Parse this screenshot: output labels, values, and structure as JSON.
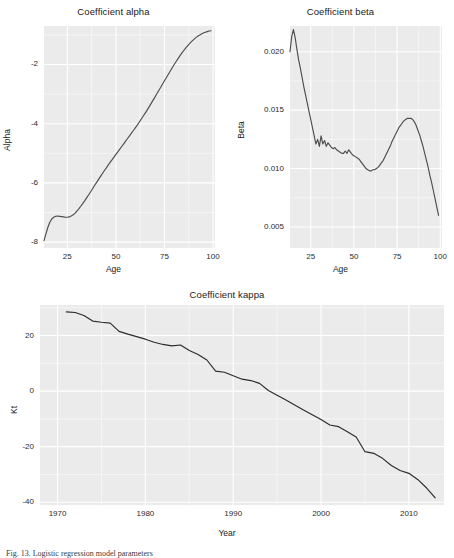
{
  "figure": {
    "caption": "Fig. 13. Logistic regression model parameters"
  },
  "chart_data": [
    {
      "id": "alpha",
      "type": "line",
      "title": "Coefficient alpha",
      "xlabel": "Age",
      "ylabel": "Alpha",
      "xlim": [
        13,
        101
      ],
      "ylim": [
        -8.2,
        -0.7
      ],
      "xticks": [
        25,
        50,
        75,
        100
      ],
      "yticks": [
        -8,
        -6,
        -4,
        -2
      ],
      "grid": true,
      "legend": "none",
      "line_color": "#4d4d4d",
      "x": [
        13,
        14,
        15,
        16,
        17,
        18,
        19,
        20,
        21,
        22,
        23,
        24,
        25,
        26,
        27,
        28,
        29,
        30,
        31,
        32,
        33,
        34,
        35,
        36,
        37,
        38,
        39,
        40,
        41,
        42,
        43,
        44,
        45,
        46,
        47,
        48,
        49,
        50,
        51,
        52,
        53,
        54,
        55,
        56,
        57,
        58,
        59,
        60,
        61,
        62,
        63,
        64,
        65,
        66,
        67,
        68,
        69,
        70,
        71,
        72,
        73,
        74,
        75,
        76,
        77,
        78,
        79,
        80,
        81,
        82,
        83,
        84,
        85,
        86,
        87,
        88,
        89,
        90,
        91,
        92,
        93,
        94,
        95,
        96,
        97,
        98,
        99
      ],
      "y": [
        -7.95,
        -7.72,
        -7.5,
        -7.33,
        -7.22,
        -7.16,
        -7.13,
        -7.12,
        -7.13,
        -7.14,
        -7.15,
        -7.16,
        -7.16,
        -7.15,
        -7.12,
        -7.08,
        -7.02,
        -6.95,
        -6.87,
        -6.78,
        -6.69,
        -6.6,
        -6.5,
        -6.4,
        -6.3,
        -6.2,
        -6.09,
        -5.99,
        -5.89,
        -5.79,
        -5.69,
        -5.59,
        -5.5,
        -5.4,
        -5.31,
        -5.22,
        -5.13,
        -5.04,
        -4.95,
        -4.86,
        -4.77,
        -4.68,
        -4.59,
        -4.5,
        -4.41,
        -4.32,
        -4.23,
        -4.14,
        -4.05,
        -3.95,
        -3.85,
        -3.75,
        -3.65,
        -3.55,
        -3.44,
        -3.33,
        -3.22,
        -3.11,
        -3.0,
        -2.89,
        -2.78,
        -2.66,
        -2.55,
        -2.44,
        -2.33,
        -2.22,
        -2.11,
        -2.0,
        -1.9,
        -1.8,
        -1.7,
        -1.61,
        -1.52,
        -1.44,
        -1.36,
        -1.29,
        -1.22,
        -1.16,
        -1.1,
        -1.05,
        -1.01,
        -0.97,
        -0.94,
        -0.91,
        -0.89,
        -0.87,
        -0.86
      ]
    },
    {
      "id": "beta",
      "type": "line",
      "title": "Coefficient beta",
      "xlabel": "Age",
      "ylabel": "Beta",
      "xlim": [
        13,
        101
      ],
      "ylim": [
        0.0032,
        0.0222
      ],
      "xticks": [
        25,
        50,
        75,
        100
      ],
      "yticks": [
        0.005,
        0.01,
        0.015,
        0.02
      ],
      "ytick_labels": [
        "0.005",
        "0.010",
        "0.015",
        "0.020"
      ],
      "grid": true,
      "legend": "none",
      "line_color": "#4d4d4d",
      "x": [
        13,
        14,
        15,
        16,
        17,
        18,
        19,
        20,
        21,
        22,
        23,
        24,
        25,
        26,
        27,
        28,
        29,
        30,
        31,
        32,
        33,
        34,
        35,
        36,
        37,
        38,
        39,
        40,
        41,
        42,
        43,
        44,
        45,
        46,
        47,
        48,
        49,
        50,
        51,
        52,
        53,
        54,
        55,
        56,
        57,
        58,
        59,
        60,
        61,
        62,
        63,
        64,
        65,
        66,
        67,
        68,
        69,
        70,
        71,
        72,
        73,
        74,
        75,
        76,
        77,
        78,
        79,
        80,
        81,
        82,
        83,
        84,
        85,
        86,
        87,
        88,
        89,
        90,
        91,
        92,
        93,
        94,
        95,
        96,
        97,
        98,
        99
      ],
      "y": [
        0.02,
        0.0213,
        0.0219,
        0.0212,
        0.0202,
        0.0193,
        0.0186,
        0.0178,
        0.017,
        0.0163,
        0.0156,
        0.0149,
        0.0142,
        0.0135,
        0.0128,
        0.0121,
        0.0125,
        0.0119,
        0.0128,
        0.0121,
        0.0124,
        0.0119,
        0.0122,
        0.012,
        0.0118,
        0.0117,
        0.0118,
        0.0116,
        0.0115,
        0.0114,
        0.0113,
        0.0113,
        0.0115,
        0.0113,
        0.0116,
        0.0114,
        0.0112,
        0.0111,
        0.011,
        0.0109,
        0.0108,
        0.0106,
        0.0104,
        0.0102,
        0.01,
        0.0099,
        0.0098,
        0.0098,
        0.0099,
        0.0099,
        0.01,
        0.0101,
        0.0103,
        0.0105,
        0.0107,
        0.011,
        0.0113,
        0.0116,
        0.0119,
        0.0123,
        0.0126,
        0.0129,
        0.0132,
        0.0135,
        0.0137,
        0.0139,
        0.0141,
        0.0142,
        0.0143,
        0.0143,
        0.0143,
        0.0142,
        0.014,
        0.0137,
        0.0133,
        0.0129,
        0.0124,
        0.0119,
        0.0113,
        0.0107,
        0.0101,
        0.0094,
        0.0088,
        0.0081,
        0.0074,
        0.0067,
        0.006,
        0.0053,
        0.0046,
        0.004
      ]
    },
    {
      "id": "kappa",
      "type": "line",
      "title": "Coefficient kappa",
      "xlabel": "Year",
      "ylabel": "Kt",
      "xlim": [
        1968,
        2014
      ],
      "ylim": [
        -41,
        31
      ],
      "xticks": [
        1970,
        1980,
        1990,
        2000,
        2010
      ],
      "yticks": [
        -40,
        -20,
        0,
        20
      ],
      "grid": true,
      "legend": "none",
      "line_color": "#2b2b2b",
      "x": [
        1971,
        1972,
        1973,
        1974,
        1975,
        1976,
        1977,
        1978,
        1979,
        1980,
        1981,
        1982,
        1983,
        1984,
        1985,
        1986,
        1987,
        1988,
        1989,
        1990,
        1991,
        1992,
        1993,
        1994,
        1995,
        1996,
        1997,
        1998,
        1999,
        2000,
        2001,
        2002,
        2003,
        2004,
        2005,
        2006,
        2007,
        2008,
        2009,
        2010,
        2011,
        2012,
        2013
      ],
      "y": [
        28.5,
        28.3,
        27.2,
        25.2,
        24.8,
        24.5,
        21.5,
        20.5,
        19.6,
        18.7,
        17.6,
        16.8,
        16.3,
        16.6,
        14.6,
        13.2,
        11.2,
        7.2,
        6.8,
        5.5,
        4.3,
        3.8,
        2.8,
        0.2,
        -1.5,
        -3.2,
        -5.0,
        -6.8,
        -8.5,
        -10.2,
        -12.2,
        -12.8,
        -14.6,
        -16.5,
        -21.8,
        -22.4,
        -24.2,
        -26.8,
        -28.6,
        -29.6,
        -31.8,
        -34.8,
        -38.4
      ]
    }
  ]
}
